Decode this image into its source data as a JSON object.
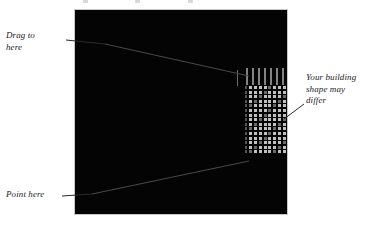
{
  "figure": {
    "background_color": "#ffffff",
    "viewport": {
      "name": "3d-viewport",
      "background_color": "#050505",
      "border_color": "#c8c8c8"
    },
    "building": {
      "name": "building-model",
      "roof_stripe_count": 7,
      "window_rows": 15,
      "window_columns": 9,
      "window_color": "#c0c0c0"
    }
  },
  "annotations": {
    "drag_to_here": {
      "line1": "Drag to",
      "line2": "here"
    },
    "point_here": {
      "line1": "Point here"
    },
    "your_building": {
      "line1": "Your building",
      "line2": "shape may",
      "line3": "differ"
    }
  }
}
